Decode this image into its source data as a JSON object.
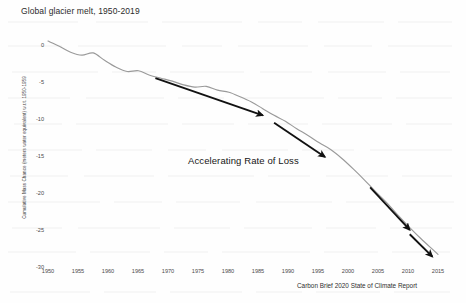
{
  "figure": {
    "title": "Global glacier melt, 1950-2019",
    "annotation": "Accelerating Rate of Loss",
    "source_caption": "Carbon Brief 2020 State of Climate Report",
    "line_color": "#9a9a9a",
    "arrow_color": "#111111",
    "text_color": "#1a1a1a",
    "background_color": "#fefefe"
  },
  "chart_data": {
    "type": "line",
    "title": "Global glacier melt, 1950-2019",
    "xlabel": "",
    "ylabel": "Cumulative Mass Chance (meters water equivalent) w.r.t. 1950-1959",
    "xlim": [
      1950,
      2019
    ],
    "ylim": [
      -30,
      2
    ],
    "grid": false,
    "legend": "none",
    "xticks": [
      1950,
      1955,
      1960,
      1965,
      1970,
      1975,
      1980,
      1985,
      1990,
      1995,
      2000,
      2005,
      2010,
      2015
    ],
    "yticks": [
      0,
      -5,
      -10,
      -15,
      -20,
      -25,
      -30
    ],
    "series": [
      {
        "name": "Cumulative glacier mass change",
        "x": [
          1950,
          1952,
          1954,
          1956,
          1958,
          1960,
          1962,
          1964,
          1966,
          1968,
          1970,
          1972,
          1974,
          1976,
          1978,
          1980,
          1982,
          1984,
          1986,
          1988,
          1990,
          1992,
          1994,
          1996,
          1998,
          2000,
          2002,
          2004,
          2006,
          2008,
          2010,
          2012,
          2014,
          2016,
          2018,
          2019
        ],
        "values": [
          0.4,
          -0.3,
          -1.1,
          -1.5,
          -1.2,
          -2.2,
          -3.1,
          -3.7,
          -3.6,
          -4.2,
          -4.6,
          -5.0,
          -5.5,
          -5.8,
          -5.7,
          -6.2,
          -6.5,
          -7.1,
          -7.8,
          -8.7,
          -9.6,
          -10.4,
          -11.4,
          -12.3,
          -13.3,
          -14.2,
          -15.4,
          -16.8,
          -18.3,
          -19.9,
          -21.4,
          -23.1,
          -24.7,
          -26.2,
          -27.6,
          -28.3
        ]
      }
    ],
    "annotations": [
      {
        "text": "Accelerating Rate of Loss",
        "x": 1983,
        "y": -16.5
      },
      {
        "type": "arrow",
        "name": "trend-arrow-1",
        "x_start": 1969,
        "y_start": -4.6,
        "x_end": 1988,
        "y_end": -9.6
      },
      {
        "type": "arrow",
        "name": "trend-arrow-2",
        "x_start": 1990,
        "y_start": -10.6,
        "x_end": 1999,
        "y_end": -15.2
      },
      {
        "type": "arrow",
        "name": "trend-arrow-3",
        "x_start": 2007,
        "y_start": -19.3,
        "x_end": 2014,
        "y_end": -25.0
      },
      {
        "type": "arrow",
        "name": "trend-arrow-4",
        "x_start": 2014,
        "y_start": -25.6,
        "x_end": 2018,
        "y_end": -28.6
      }
    ]
  },
  "y_tick_labels": [
    "0",
    "-5",
    "-10",
    "-15",
    "-20",
    "-25",
    "-30"
  ],
  "x_tick_labels": [
    "1950",
    "1955",
    "1960",
    "1965",
    "1970",
    "1975",
    "1980",
    "1985",
    "1990",
    "1995",
    "2000",
    "2005",
    "2010",
    "2015"
  ]
}
